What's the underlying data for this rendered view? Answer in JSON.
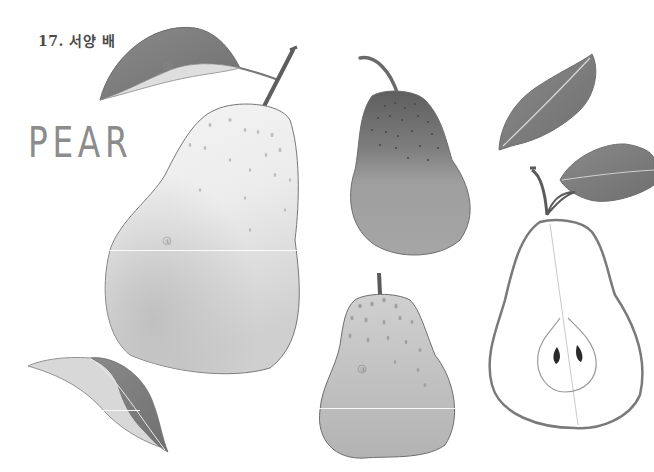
{
  "page": {
    "heading": "17. 서양 배",
    "title_word": "PEAR"
  },
  "illustrations": {
    "big_pear": {
      "label": "①"
    },
    "dark_pear": {
      "label": ""
    },
    "small_pear": {
      "label": "③"
    },
    "top_leaf": {
      "label": "④"
    },
    "half_pear": {
      "label": ""
    }
  },
  "colors": {
    "outline": "#6e6e6e",
    "leaf_dark": "#7d7d7d",
    "leaf_light": "#d6d6d6",
    "pear_light": "#ececec",
    "pear_mid": "#b5b5b5",
    "pear_dark": "#8a8a8a",
    "stem": "#6a6a6a"
  }
}
